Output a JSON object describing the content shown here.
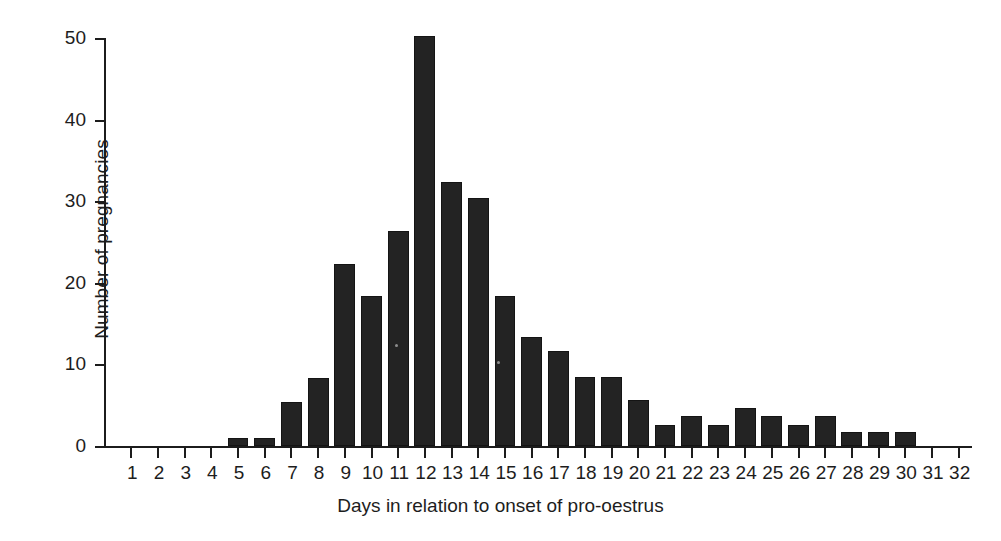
{
  "chart_data": {
    "type": "bar",
    "title": "",
    "xlabel": "Days in relation to onset of pro-oestrus",
    "ylabel": "Number of pregnancies",
    "categories": [
      "1",
      "2",
      "3",
      "4",
      "5",
      "6",
      "7",
      "8",
      "9",
      "10",
      "11",
      "12",
      "13",
      "14",
      "15",
      "16",
      "17",
      "18",
      "19",
      "20",
      "21",
      "22",
      "23",
      "24",
      "25",
      "26",
      "27",
      "28",
      "29",
      "30",
      "31",
      "32"
    ],
    "values": [
      0,
      0,
      0,
      0,
      1,
      1,
      5.4,
      8.3,
      22.3,
      18.4,
      26.4,
      50.3,
      32.4,
      30.4,
      18.4,
      13.4,
      11.6,
      8.4,
      8.4,
      5.6,
      2.6,
      3.7,
      2.6,
      4.7,
      3.7,
      2.6,
      3.7,
      1.7,
      1.7,
      1.7,
      0,
      0
    ],
    "ylim": [
      0,
      50
    ],
    "yticks": [
      0,
      10,
      20,
      30,
      40,
      50
    ],
    "ytick_labels": [
      "0",
      "10",
      "20",
      "30",
      "40",
      "50"
    ],
    "xlim": [
      0.5,
      32.5
    ],
    "grid": false,
    "legend": null,
    "bar_color": "#232323",
    "axis_color": "#1c1c1c",
    "bar_width_fraction": 0.78
  }
}
